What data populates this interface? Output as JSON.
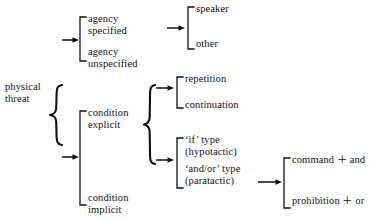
{
  "diagram": {
    "root": {
      "label": "physical\nthreat"
    },
    "level1": [
      {
        "id": "agency-specified",
        "label": "agency\nspecified"
      },
      {
        "id": "agency-unspecified",
        "label": "agency\nunspecified"
      },
      {
        "id": "condition-explicit",
        "label": "condition\nexplicit"
      },
      {
        "id": "condition-implicit",
        "label": "condition\nimplicit"
      }
    ],
    "level2": [
      {
        "id": "speaker",
        "label": "speaker"
      },
      {
        "id": "other",
        "label": "other"
      },
      {
        "id": "repetition",
        "label": "repetition"
      },
      {
        "id": "continuation",
        "label": "continuation"
      },
      {
        "id": "if-type",
        "label": "‘if’ type\n(hypotactic)"
      },
      {
        "id": "and-or-type",
        "label": "‘and/or’ type\n(paratactic)"
      }
    ],
    "level3": [
      {
        "id": "command-and",
        "label": "command ＋ and"
      },
      {
        "id": "prohibition-or",
        "label": "prohibition ＋ or"
      }
    ],
    "colors": {
      "ink": "#111111",
      "background": "#ffffff"
    }
  }
}
